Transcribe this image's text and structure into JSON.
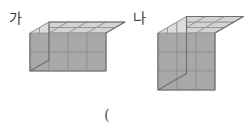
{
  "page": {
    "background": "#ffffff",
    "width": 246,
    "height": 137
  },
  "labels": {
    "shape_a": "가",
    "shape_b": "나",
    "paren_open": "("
  },
  "colors": {
    "top_face": "#d3d3d3",
    "left_face": "#dcdcdc",
    "right_face": "#a8a8a8",
    "edge_outer": "#6e6e6e",
    "edge_inner": "#8f8f8f",
    "label_text": "#3a3a3a",
    "paren_text": "#5a5a5a"
  },
  "chart_data": {
    "type": "diagram",
    "title": "",
    "figures": [
      {
        "name": "가",
        "shape": "rectangular-prism",
        "dimensions": {
          "length": 4,
          "depth": 2,
          "height": 2
        },
        "unit_cube_count": 16,
        "origin": {
          "x": 30,
          "y": 33
        },
        "cube_size": 19,
        "iso": {
          "dx": 9.5,
          "dy": -5.5
        }
      },
      {
        "name": "나",
        "shape": "cube",
        "dimensions": {
          "length": 3,
          "depth": 3,
          "height": 3
        },
        "unit_cube_count": 27,
        "origin": {
          "x": 158,
          "y": 33
        },
        "cube_size": 19,
        "iso": {
          "dx": 9.5,
          "dy": -5.5
        }
      }
    ]
  }
}
